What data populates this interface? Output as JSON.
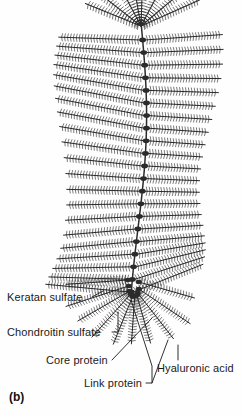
{
  "figure": {
    "caption": "(b)",
    "background_color": "#fefefe",
    "ink_color": "#2b2b2b",
    "width": 243,
    "height": 416
  },
  "labels": [
    {
      "id": "keratan-sulfate",
      "text": "Keratan sulfate",
      "leader": "short-diagonal-up-right"
    },
    {
      "id": "chondroitin-sulfate",
      "text": "Chondroitin sulfate",
      "leader": "elbow-up-right"
    },
    {
      "id": "core-protein",
      "text": "Core protein",
      "leader": "long-diagonal-up-right"
    },
    {
      "id": "link-protein",
      "text": "Link protein",
      "leader": "elbow-up-right"
    },
    {
      "id": "hyaluronic-acid",
      "text": "Hyaluronic acid",
      "leader": "vertical-up"
    }
  ],
  "structure": {
    "name": "proteoglycan-aggregate",
    "backbone": {
      "name": "hyaluronic-acid-backbone",
      "orientation": "vertical",
      "link_protein_count": 21
    },
    "monomer": {
      "name": "aggrecan-monomer",
      "appearance": "feathered-bristle-chain",
      "bristle_label_left": "keratan sulfate / chondroitin sulfate side chains"
    },
    "fan_top": {
      "name": "top-radiating-fan",
      "chain_count": 7
    },
    "fan_bottom": {
      "name": "bottom-radiating-fan",
      "chain_count": 8
    }
  }
}
